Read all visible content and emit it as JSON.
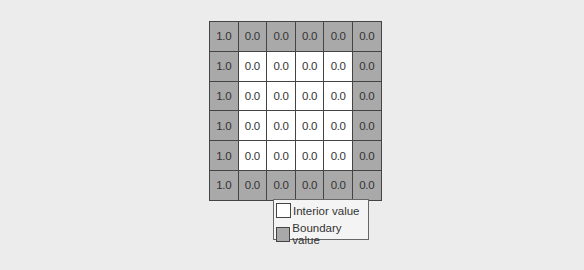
{
  "grid": {
    "rows": [
      [
        {
          "v": "1.0",
          "t": "boundary"
        },
        {
          "v": "0.0",
          "t": "boundary"
        },
        {
          "v": "0.0",
          "t": "boundary"
        },
        {
          "v": "0.0",
          "t": "boundary"
        },
        {
          "v": "0.0",
          "t": "boundary"
        },
        {
          "v": "0.0",
          "t": "boundary"
        }
      ],
      [
        {
          "v": "1.0",
          "t": "boundary"
        },
        {
          "v": "0.0",
          "t": "interior"
        },
        {
          "v": "0.0",
          "t": "interior"
        },
        {
          "v": "0.0",
          "t": "interior"
        },
        {
          "v": "0.0",
          "t": "interior"
        },
        {
          "v": "0.0",
          "t": "boundary"
        }
      ],
      [
        {
          "v": "1.0",
          "t": "boundary"
        },
        {
          "v": "0.0",
          "t": "interior"
        },
        {
          "v": "0.0",
          "t": "interior"
        },
        {
          "v": "0.0",
          "t": "interior"
        },
        {
          "v": "0.0",
          "t": "interior"
        },
        {
          "v": "0.0",
          "t": "boundary"
        }
      ],
      [
        {
          "v": "1.0",
          "t": "boundary"
        },
        {
          "v": "0.0",
          "t": "interior"
        },
        {
          "v": "0.0",
          "t": "interior"
        },
        {
          "v": "0.0",
          "t": "interior"
        },
        {
          "v": "0.0",
          "t": "interior"
        },
        {
          "v": "0.0",
          "t": "boundary"
        }
      ],
      [
        {
          "v": "1.0",
          "t": "boundary"
        },
        {
          "v": "0.0",
          "t": "interior"
        },
        {
          "v": "0.0",
          "t": "interior"
        },
        {
          "v": "0.0",
          "t": "interior"
        },
        {
          "v": "0.0",
          "t": "interior"
        },
        {
          "v": "0.0",
          "t": "boundary"
        }
      ],
      [
        {
          "v": "1.0",
          "t": "boundary"
        },
        {
          "v": "0.0",
          "t": "boundary"
        },
        {
          "v": "0.0",
          "t": "boundary"
        },
        {
          "v": "0.0",
          "t": "boundary"
        },
        {
          "v": "0.0",
          "t": "boundary"
        },
        {
          "v": "0.0",
          "t": "boundary"
        }
      ]
    ]
  },
  "legend": {
    "interior_label": "Interior value",
    "boundary_label": "Boundary value"
  },
  "colors": {
    "boundary": "#a9a9a9",
    "interior": "#ffffff",
    "background": "#ececec"
  }
}
